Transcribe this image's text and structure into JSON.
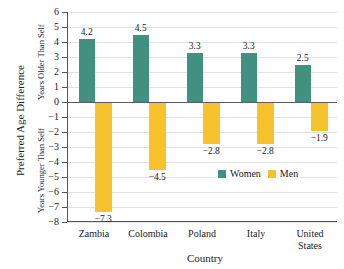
{
  "chart_data": {
    "type": "bar",
    "title": "",
    "xlabel": "Country",
    "ylabel": "Preferred Age Difference",
    "ylabel_upper": "Years Older Than Self",
    "ylabel_lower": "Years Younger Than Self",
    "categories": [
      "Zambia",
      "Colombia",
      "Poland",
      "Italy",
      "United States"
    ],
    "series": [
      {
        "name": "Women",
        "color": "#42907f",
        "values": [
          4.2,
          4.5,
          3.3,
          3.3,
          2.5
        ],
        "labels": [
          "4.2",
          "4.5",
          "3.3",
          "3.3",
          "2.5"
        ]
      },
      {
        "name": "Men",
        "color": "#f6c32c",
        "values": [
          -7.3,
          -4.5,
          -2.8,
          -2.8,
          -1.9
        ],
        "labels": [
          "−7.3",
          "−4.5",
          "−2.8",
          "−2.8",
          "−1.9"
        ]
      }
    ],
    "ylim": [
      -8,
      6
    ],
    "yticks": [
      6,
      5,
      4,
      3,
      2,
      1,
      0,
      -1,
      -2,
      -3,
      -4,
      -5,
      -6,
      -7,
      -8
    ],
    "yticklabels": [
      "6",
      "5",
      "4",
      "3",
      "2",
      "1",
      "0",
      "−1",
      "−2",
      "−3",
      "−4",
      "−5",
      "−6",
      "−7",
      "−8"
    ],
    "grid": true,
    "legend_position": "center-right-inside",
    "legend": [
      {
        "label": "Women",
        "color": "#42907f"
      },
      {
        "label": "Men",
        "color": "#f6c32c"
      }
    ]
  }
}
